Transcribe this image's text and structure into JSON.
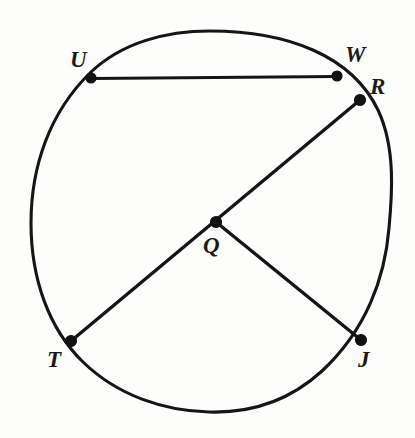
{
  "figure": {
    "background_color": "#fdfdfc",
    "stroke_color": "#151515",
    "label_color": "#1a1a1a",
    "width": 415,
    "height": 438
  },
  "circle": {
    "name": "circle-Q",
    "center_label": "Q",
    "cx": 210,
    "cy": 221,
    "rx": 180,
    "ry": 190,
    "stroke_width": 3.1
  },
  "points": [
    {
      "id": "U",
      "label": "U",
      "x": 91,
      "y": 78,
      "label_x": 70,
      "label_y": 48,
      "role": "chord-endpoint"
    },
    {
      "id": "W",
      "label": "W",
      "x": 337,
      "y": 76,
      "label_x": 345,
      "label_y": 43,
      "role": "chord-endpoint"
    },
    {
      "id": "R",
      "label": "R",
      "x": 360,
      "y": 100,
      "label_x": 370,
      "label_y": 75,
      "role": "radius-endpoint"
    },
    {
      "id": "T",
      "label": "T",
      "x": 71,
      "y": 341,
      "label_x": 47,
      "label_y": 348,
      "role": "radius-endpoint"
    },
    {
      "id": "J",
      "label": "J",
      "x": 361,
      "y": 340,
      "label_x": 358,
      "label_y": 348,
      "role": "radius-endpoint"
    },
    {
      "id": "Q",
      "label": "Q",
      "x": 216,
      "y": 222,
      "label_x": 203,
      "label_y": 234,
      "role": "center"
    }
  ],
  "segments": [
    {
      "id": "UW",
      "from": "U",
      "to": "W",
      "kind": "chord",
      "x1": 91,
      "y1": 78,
      "x2": 337,
      "y2": 76
    },
    {
      "id": "TR",
      "from": "T",
      "to": "R",
      "kind": "diameter",
      "x1": 71,
      "y1": 341,
      "x2": 360,
      "y2": 100
    },
    {
      "id": "QJ",
      "from": "Q",
      "to": "J",
      "kind": "radius",
      "x1": 216,
      "y1": 222,
      "x2": 361,
      "y2": 340
    }
  ],
  "labels": {
    "U": "U",
    "W": "W",
    "R": "R",
    "T": "T",
    "J": "J",
    "Q": "Q"
  }
}
